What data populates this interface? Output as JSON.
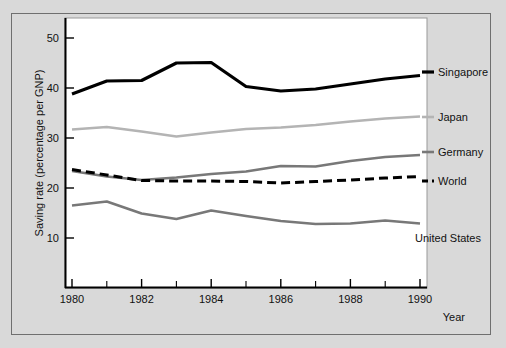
{
  "chart_data": {
    "type": "line",
    "title": "",
    "subtitle": "",
    "xlabel": "Year",
    "ylabel": "Saving rate (percentage per GNP)",
    "xlim": [
      1980,
      1990
    ],
    "ylim": [
      0,
      55
    ],
    "grid": false,
    "legend_position": "right-inline-labels",
    "x": [
      1980,
      1981,
      1982,
      1983,
      1984,
      1985,
      1986,
      1987,
      1988,
      1989,
      1990
    ],
    "x_tick_labels": [
      "1980",
      "1982",
      "1984",
      "1986",
      "1988",
      "1990"
    ],
    "x_tick_values": [
      1980,
      1982,
      1984,
      1986,
      1988,
      1990
    ],
    "x_minor_ticks": [
      1981,
      1983,
      1985,
      1987,
      1989
    ],
    "y_tick_labels": [
      "10",
      "20",
      "30",
      "40",
      "50"
    ],
    "y_tick_values": [
      10,
      20,
      30,
      40,
      50
    ],
    "series": [
      {
        "name": "Singapore",
        "color": "#000000",
        "style": "solid",
        "width": 3.2,
        "values": [
          38.8,
          41.4,
          41.5,
          45.0,
          45.1,
          40.3,
          39.4,
          39.8,
          40.8,
          41.8,
          42.5
        ]
      },
      {
        "name": "Japan",
        "color": "#b4b4b4",
        "style": "solid",
        "width": 2.6,
        "values": [
          31.7,
          32.2,
          31.3,
          30.3,
          31.1,
          31.8,
          32.1,
          32.6,
          33.3,
          33.9,
          34.3
        ]
      },
      {
        "name": "Germany",
        "color": "#787878",
        "style": "solid",
        "width": 2.6,
        "values": [
          23.4,
          22.3,
          21.6,
          22.1,
          22.8,
          23.3,
          24.4,
          24.3,
          25.4,
          26.2,
          26.6
        ]
      },
      {
        "name": "World",
        "color": "#000000",
        "style": "dashed",
        "width": 3.0,
        "values": [
          23.7,
          22.6,
          21.5,
          21.4,
          21.4,
          21.3,
          21.0,
          21.3,
          21.6,
          22.0,
          22.3
        ]
      },
      {
        "name": "United States",
        "color": "#787878",
        "style": "solid",
        "width": 2.6,
        "values": [
          16.5,
          17.3,
          14.9,
          13.8,
          15.5,
          14.4,
          13.4,
          12.8,
          12.9,
          13.5,
          12.9
        ]
      }
    ]
  },
  "labels": {
    "y_axis_title": "Saving rate (percentage per GNP)",
    "x_axis_title": "Year",
    "series_singapore": "Singapore",
    "series_japan": "Japan",
    "series_germany": "Germany",
    "series_world": "World",
    "series_united_states": "United States"
  },
  "ticks": {
    "y": [
      "50",
      "40",
      "30",
      "20",
      "10"
    ],
    "x": [
      "1980",
      "1982",
      "1984",
      "1986",
      "1988",
      "1990"
    ]
  },
  "colors": {
    "background": "#d9d9d9",
    "plot_background": "#ffffff",
    "axis": "#000000",
    "singapore": "#000000",
    "japan": "#b4b4b4",
    "germany": "#787878",
    "world": "#000000",
    "united_states": "#787878"
  }
}
